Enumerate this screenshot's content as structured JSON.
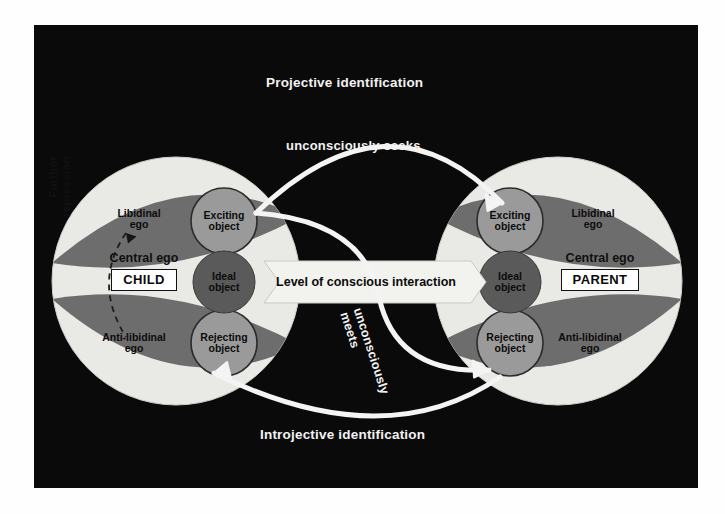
{
  "diagram": {
    "background_color": "#0a0a0a",
    "frame": {
      "x": 34,
      "y": 25,
      "width": 664,
      "height": 463
    }
  },
  "colors": {
    "panel_background": "#0a0a0a",
    "central_ego_fill": "#e9e9e6",
    "lens_fill": "#6d6d6d",
    "object_circle_fill": "#9a9a9a",
    "ideal_object_fill": "#5a5a5a",
    "arrow_white": "#f4f4f4",
    "text_light": "#f2f2f2",
    "text_dark": "#0d0d0d"
  },
  "flow_labels": {
    "projective": "Projective identification",
    "unconsciously_seeks": "unconsciously seeks",
    "unconsciously_meets_line1": "unconsciously",
    "unconsciously_meets_line2": "meets",
    "introjective": "Introjective identification",
    "further_repression_line1": "Further",
    "further_repression_line2": "repression"
  },
  "banner": {
    "label": "Level of conscious interaction"
  },
  "child": {
    "id": "CHILD",
    "central_ego_label": "Central ego",
    "identity_label": "CHILD",
    "libidinal_ego": "Libidinal\nego",
    "libidinal_ego_line1": "Libidinal",
    "libidinal_ego_line2": "ego",
    "exciting_object_line1": "Exciting",
    "exciting_object_line2": "object",
    "ideal_object_line1": "Ideal",
    "ideal_object_line2": "object",
    "anti_libidinal_ego_line1": "Anti-libidinal",
    "anti_libidinal_ego_line2": "ego",
    "rejecting_object_line1": "Rejecting",
    "rejecting_object_line2": "object"
  },
  "parent": {
    "id": "PARENT",
    "central_ego_label": "Central ego",
    "identity_label": "PARENT",
    "libidinal_ego_line1": "Libidinal",
    "libidinal_ego_line2": "ego",
    "exciting_object_line1": "Exciting",
    "exciting_object_line2": "object",
    "ideal_object_line1": "Ideal",
    "ideal_object_line2": "object",
    "anti_libidinal_ego_line1": "Anti-libidinal",
    "anti_libidinal_ego_line2": "ego",
    "rejecting_object_line1": "Rejecting",
    "rejecting_object_line2": "object"
  }
}
